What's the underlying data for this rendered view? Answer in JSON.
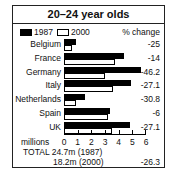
{
  "chart_data": {
    "type": "bar",
    "orientation": "horizontal",
    "title": "20–24 year olds",
    "xlabel": "millions",
    "ylabel": "",
    "xlim": [
      0,
      6
    ],
    "xticks": [
      0,
      1,
      2,
      3,
      4,
      5,
      6
    ],
    "grid": false,
    "legend_position": "top-left",
    "categories": [
      "Belgium",
      "France",
      "Germany",
      "Italy",
      "Netherlands",
      "Spain",
      "UK"
    ],
    "series": [
      {
        "name": "1987",
        "style": "filled-black",
        "values": [
          0.9,
          4.4,
          5.6,
          4.9,
          1.5,
          3.4,
          4.8
        ]
      },
      {
        "name": "2000",
        "style": "outline-white",
        "values": [
          0.6,
          3.7,
          3.0,
          3.6,
          0.9,
          3.2,
          3.5
        ]
      }
    ],
    "pct_change_header": "% change",
    "pct_change": [
      "-25",
      "-14",
      "-46.2",
      "-27.1",
      "-30.8",
      "-6",
      "-27.1"
    ],
    "totals": {
      "label": "TOTAL",
      "line1": "24.7m (1987)",
      "line2": "18.2m (2000)",
      "pct_change": "-26.3"
    }
  },
  "labels": {
    "title": "20–24 year olds",
    "legend_1987": "1987",
    "legend_2000": "2000",
    "pct_header": "% change",
    "unit": "millions",
    "total_line1": "TOTAL 24.7m (1987)",
    "total_line2": "18.2m (2000)",
    "total_pct": "-26.3",
    "ticks": [
      "0",
      "1",
      "2",
      "3",
      "4",
      "5",
      "6"
    ]
  }
}
